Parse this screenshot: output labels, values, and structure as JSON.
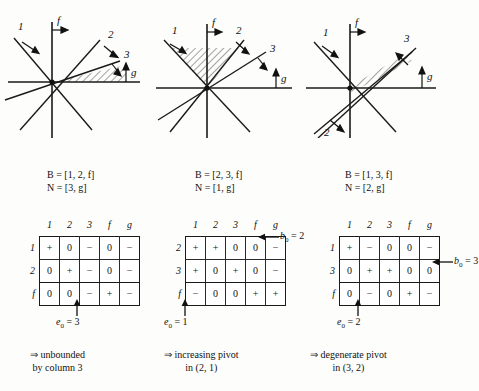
{
  "figure": {
    "title": "",
    "panels": [
      {
        "id": "panel-0",
        "diagram": {
          "name": "cone-diagram-1",
          "axis_labels": {
            "vertical": "f",
            "horizontal": "g"
          },
          "ray_labels": [
            "1",
            "2",
            "3"
          ],
          "shaded_region": "cone between ray 2 and ray 3 above g-axis"
        },
        "sets": {
          "basis_line": "B = [1, 2, f]",
          "nonbasis_line": "N = [3, g]"
        },
        "table": {
          "name": "sign-table-1",
          "col_headers": [
            "1",
            "2",
            "3",
            "f",
            "g"
          ],
          "row_headers": [
            "1",
            "2",
            "f"
          ],
          "rows": [
            [
              "+",
              "0",
              "−",
              "0",
              "−"
            ],
            [
              "0",
              "+",
              "−",
              "0",
              "−"
            ],
            [
              "0",
              "0",
              "−",
              "+",
              "−"
            ]
          ]
        },
        "e0": {
          "label": "e",
          "sub": "0",
          "eq": "= 3",
          "text": "e0 = 3",
          "points_to_col": 3
        },
        "b0": null,
        "conclusion": {
          "arrow": "⇒",
          "line1": "unbounded",
          "line2": "by column 3"
        }
      },
      {
        "id": "panel-1",
        "diagram": {
          "name": "cone-diagram-2",
          "axis_labels": {
            "vertical": "f",
            "horizontal": "g"
          },
          "ray_labels": [
            "1",
            "2",
            "3"
          ],
          "shaded_region": "cone between ray 1 and ray 2 above origin"
        },
        "sets": {
          "basis_line": "B = [2, 3, f]",
          "nonbasis_line": "N = [1, g]"
        },
        "table": {
          "name": "sign-table-2",
          "col_headers": [
            "1",
            "2",
            "3",
            "f",
            "g"
          ],
          "row_headers": [
            "2",
            "3",
            "f"
          ],
          "rows": [
            [
              "+",
              "+",
              "0",
              "0",
              "−"
            ],
            [
              "+",
              "0",
              "+",
              "0",
              "−"
            ],
            [
              "−",
              "0",
              "0",
              "+",
              "+"
            ]
          ]
        },
        "e0": {
          "label": "e",
          "sub": "0",
          "eq": "= 1",
          "text": "e0 = 1",
          "points_to_col": 1
        },
        "b0": {
          "label": "b",
          "sub": "0",
          "eq": "= 2",
          "text": "b0 = 2",
          "points_to_row": 1
        },
        "conclusion": {
          "arrow": "⇒",
          "line1": "increasing pivot",
          "line2": "in (2, 1)"
        }
      },
      {
        "id": "panel-2",
        "diagram": {
          "name": "cone-diagram-3",
          "axis_labels": {
            "vertical": "f",
            "horizontal": "g"
          },
          "ray_labels": [
            "1",
            "2",
            "3"
          ],
          "shaded_region": "degenerate sliver along ray 3"
        },
        "sets": {
          "basis_line": "B = [1, 3, f]",
          "nonbasis_line": "N = [2, g]"
        },
        "table": {
          "name": "sign-table-3",
          "col_headers": [
            "1",
            "2",
            "3",
            "f",
            "g"
          ],
          "row_headers": [
            "1",
            "3",
            "f"
          ],
          "rows": [
            [
              "+",
              "−",
              "0",
              "0",
              "−"
            ],
            [
              "0",
              "+",
              "+",
              "0",
              "0"
            ],
            [
              "0",
              "−",
              "0",
              "+",
              "−"
            ]
          ]
        },
        "e0": {
          "label": "e",
          "sub": "0",
          "eq": "= 2",
          "text": "e0 = 2",
          "points_to_col": 2
        },
        "b0": {
          "label": "b",
          "sub": "0",
          "eq": "= 3",
          "text": "b0 = 3",
          "points_to_row": 2
        },
        "conclusion": {
          "arrow": "⇒",
          "line1": "degenerate pivot",
          "line2": "in (3, 2)"
        }
      }
    ]
  },
  "colors": {
    "background": "#fdfdfb",
    "ink": "#111111",
    "rule": "#1a1a1a",
    "hatch": "#333333"
  }
}
